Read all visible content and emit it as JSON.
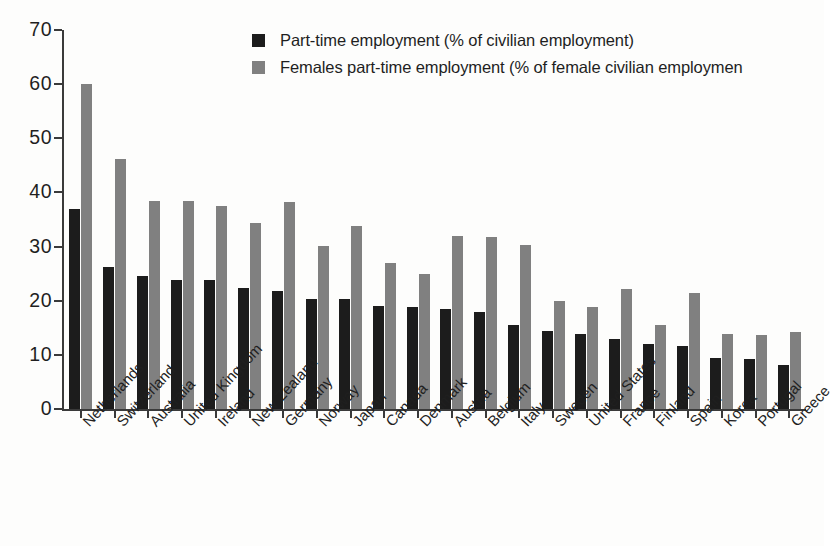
{
  "legend": {
    "position": "top-center",
    "items": [
      {
        "label": "Part-time employment (% of civilian employment)",
        "color": "#1c1c1c",
        "swatch_name": "legend-swatch-part-time"
      },
      {
        "label": "Females part-time employment (% of female civilian employmen",
        "color": "#808080",
        "swatch_name": "legend-swatch-females-part-time"
      }
    ]
  },
  "axis": {
    "y_ticks": [
      "70",
      "60",
      "50",
      "40",
      "30",
      "20",
      "10",
      "0"
    ]
  },
  "chart_data": {
    "type": "bar",
    "title": "",
    "subtitle": "",
    "xlabel": "",
    "ylabel": "",
    "ylim": [
      0,
      70
    ],
    "ytick_values": [
      0,
      10,
      20,
      30,
      40,
      50,
      60,
      70
    ],
    "grid": false,
    "legend_position": "top-center",
    "categories": [
      "Netherlands",
      "Switzerland",
      "Australia",
      "United Kingdom",
      "Ireland",
      "New Zealand",
      "Germany",
      "Norway",
      "Japan",
      "Canada",
      "Denmark",
      "Austria",
      "Belgium",
      "Italy",
      "Sweden",
      "United States",
      "France",
      "Finland",
      "Spain",
      "Korea",
      "Portugal",
      "Greece"
    ],
    "series": [
      {
        "name": "Part-time employment (% of civilian employment)",
        "color": "#1c1c1c",
        "values": [
          37.0,
          26.2,
          24.5,
          23.9,
          23.9,
          22.3,
          21.8,
          20.3,
          20.3,
          19.1,
          18.8,
          18.5,
          18.0,
          15.5,
          14.4,
          13.9,
          12.9,
          12.1,
          11.7,
          9.5,
          9.2,
          8.1
        ]
      },
      {
        "name": "Females part-time employment (% of female civilian employment)",
        "color": "#808080",
        "values": [
          60.0,
          46.2,
          38.5,
          38.4,
          37.5,
          34.4,
          38.3,
          30.1,
          33.8,
          27.0,
          24.9,
          32.0,
          31.7,
          30.3,
          19.9,
          18.9,
          22.2,
          15.5,
          21.4,
          13.9,
          13.6,
          14.2
        ]
      }
    ]
  }
}
